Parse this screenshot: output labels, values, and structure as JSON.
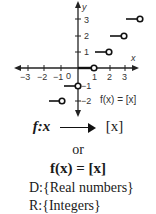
{
  "graph": {
    "x_axis_label": "x",
    "y_axis_label": "y",
    "x_ticks": [
      "−3",
      "−2",
      "−1",
      "0",
      "1",
      "2",
      "3"
    ],
    "y_ticks": [
      "3",
      "2",
      "1",
      "−1",
      "−2"
    ],
    "function_label": "f(x) = [x]",
    "steps": [
      {
        "from": -3,
        "to": -2,
        "y": -2
      },
      {
        "from": -1,
        "to": 0,
        "y": -1
      },
      {
        "from": 0,
        "to": 1,
        "y": 0
      },
      {
        "from": 1,
        "to": 2,
        "y": 1
      },
      {
        "from": 2,
        "to": 3,
        "y": 2
      },
      {
        "from": 3,
        "to": 4,
        "y": 3
      }
    ]
  },
  "mapping": {
    "f": "f:x",
    "result": "[x]"
  },
  "or_text": "or",
  "equation": "f(x) = [x]",
  "domain_text": "D:{Real numbers}",
  "range_text": "R:{Integers}"
}
